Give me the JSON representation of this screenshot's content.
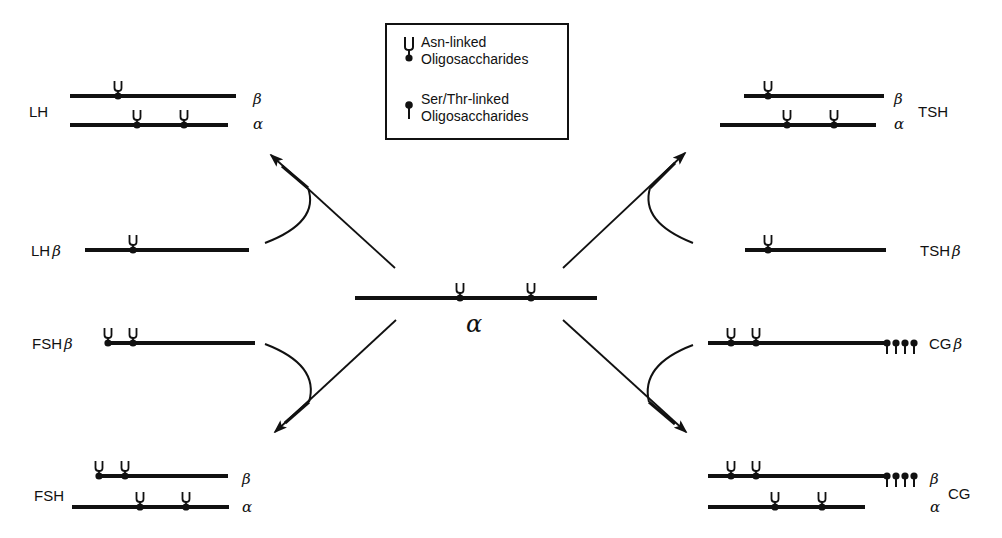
{
  "legend": {
    "asn_line1": "Asn-linked",
    "asn_line2": "Oligosaccharides",
    "ser_line1": "Ser/Thr-linked",
    "ser_line2": "Oligosaccharides",
    "asn_icon": "asn-linked-fork-icon",
    "ser_icon": "ser-thr-linked-pin-icon"
  },
  "center": {
    "subunit": "α"
  },
  "hormones": {
    "lh": {
      "name": "LH",
      "beta": "β",
      "alpha": "α"
    },
    "tsh": {
      "name": "TSH",
      "beta": "β",
      "alpha": "α"
    },
    "fsh": {
      "name": "FSH",
      "beta": "β",
      "alpha": "α"
    },
    "cg": {
      "name": "CG",
      "beta": "β",
      "alpha": "α"
    }
  },
  "beta_subunits": {
    "lh_beta": {
      "name": "LH",
      "greek": "β"
    },
    "tsh_beta": {
      "name": "TSH",
      "greek": "β"
    },
    "fsh_beta": {
      "name": "FSH",
      "greek": "β"
    },
    "cg_beta": {
      "name": "CG",
      "greek": "β"
    }
  }
}
